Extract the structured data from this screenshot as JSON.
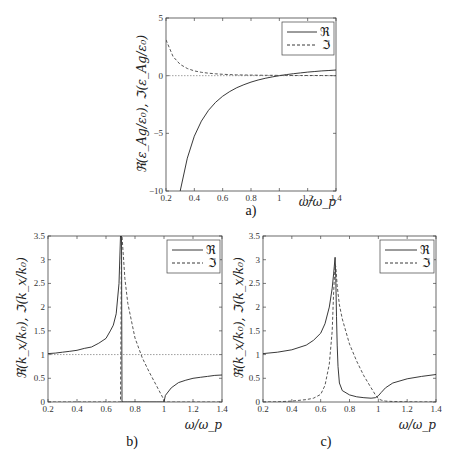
{
  "figure": {
    "panels": [
      {
        "id": "a",
        "caption": "a)",
        "ylabel": "ℜ(ε_Ag/ε₀), ℑ(ε_Ag/ε₀)",
        "xlabel": "ω/ω_p",
        "legend": [
          "ℜ",
          "ℑ"
        ],
        "box": {
          "x0": 166,
          "y0": 18,
          "x1": 336,
          "y1": 191
        },
        "xlim": [
          0.2,
          1.4
        ],
        "ylim": [
          -10,
          5
        ],
        "xticks": [
          "0.2",
          "0.4",
          "0.6",
          "0.8",
          "1",
          "1.2",
          "1.4"
        ],
        "yticks": [
          "-10",
          "-5",
          "0",
          "5"
        ],
        "ytick_values": [
          -10,
          -5,
          0,
          5
        ],
        "hline": 0,
        "legend_box": {
          "x": 282,
          "y": 22,
          "w": 52,
          "h": 33
        }
      },
      {
        "id": "b",
        "caption": "b)",
        "ylabel": "ℜ(k_x/k₀), ℑ(k_x/k₀)",
        "xlabel": "ω/ω_p",
        "legend": [
          "ℜ",
          "ℑ"
        ],
        "box": {
          "x0": 48,
          "y0": 236,
          "x1": 222,
          "y1": 402
        },
        "xlim": [
          0.2,
          1.4
        ],
        "ylim": [
          0,
          3.5
        ],
        "xticks": [
          "0.2",
          "0.4",
          "0.6",
          "0.8",
          "1",
          "1.2",
          "1.4"
        ],
        "yticks": [
          "0",
          "0.5",
          "1",
          "1.5",
          "2",
          "2.5",
          "3",
          "3.5"
        ],
        "ytick_values": [
          0,
          0.5,
          1,
          1.5,
          2,
          2.5,
          3,
          3.5
        ],
        "hline": 1,
        "legend_box": {
          "x": 167,
          "y": 240,
          "w": 53,
          "h": 33
        }
      },
      {
        "id": "c",
        "caption": "c)",
        "ylabel": "ℜ(k_x/k₀), ℑ(k_x/k₀)",
        "xlabel": "ω/ω_p",
        "legend": [
          "ℜ",
          "ℑ"
        ],
        "box": {
          "x0": 263,
          "y0": 236,
          "x1": 436,
          "y1": 402
        },
        "xlim": [
          0.2,
          1.4
        ],
        "ylim": [
          0,
          3.5
        ],
        "xticks": [
          "0.2",
          "0.4",
          "0.6",
          "0.8",
          "1",
          "1.2",
          "1.4"
        ],
        "yticks": [
          "0",
          "0.5",
          "1",
          "1.5",
          "2",
          "2.5",
          "3",
          "3.5"
        ],
        "ytick_values": [
          0,
          0.5,
          1,
          1.5,
          2,
          2.5,
          3,
          3.5
        ],
        "hline": null,
        "legend_box": {
          "x": 380,
          "y": 240,
          "w": 54,
          "h": 33
        }
      }
    ]
  },
  "chart_data": [
    {
      "type": "line",
      "title": "a)",
      "xlabel": "ω/ω_p",
      "ylabel": "ℜ(ε_Ag/ε₀), ℑ(ε_Ag/ε₀)",
      "xlim": [
        0.2,
        1.4
      ],
      "ylim": [
        -10,
        5
      ],
      "legend_position": "upper right",
      "x": [
        0.2,
        0.25,
        0.3,
        0.35,
        0.4,
        0.45,
        0.5,
        0.55,
        0.6,
        0.65,
        0.7,
        0.75,
        0.8,
        0.85,
        0.9,
        0.95,
        1.0,
        1.05,
        1.1,
        1.15,
        1.2,
        1.25,
        1.3,
        1.35,
        1.4
      ],
      "series": [
        {
          "name": "ℜ",
          "style": "solid",
          "values": [
            null,
            null,
            -10.1,
            -7.16,
            -5.25,
            -3.94,
            -3.0,
            -2.31,
            -1.78,
            -1.37,
            -1.04,
            -0.78,
            -0.56,
            -0.38,
            -0.23,
            -0.11,
            0.0,
            0.09,
            0.17,
            0.24,
            0.31,
            0.36,
            0.41,
            0.45,
            0.49
          ]
        },
        {
          "name": "ℑ",
          "style": "dashed",
          "values": [
            3.1,
            1.65,
            0.98,
            0.62,
            0.41,
            0.29,
            0.21,
            0.16,
            0.12,
            0.09,
            0.07,
            0.06,
            0.05,
            0.04,
            0.035,
            0.03,
            0.025,
            0.02,
            0.018,
            0.016,
            0.014,
            0.012,
            0.011,
            0.01,
            0.009
          ]
        }
      ],
      "reference_line": {
        "y": 0,
        "style": "dotted"
      }
    },
    {
      "type": "line",
      "title": "b)",
      "xlabel": "ω/ω_p",
      "ylabel": "ℜ(k_x/k₀), ℑ(k_x/k₀)",
      "xlim": [
        0.2,
        1.4
      ],
      "ylim": [
        0,
        3.5
      ],
      "legend_position": "upper right",
      "x": [
        0.2,
        0.25,
        0.3,
        0.35,
        0.4,
        0.45,
        0.5,
        0.55,
        0.6,
        0.63,
        0.65,
        0.67,
        0.69,
        0.7,
        0.707,
        0.71,
        0.73,
        0.75,
        0.8,
        0.85,
        0.9,
        0.95,
        0.99,
        1.0,
        1.01,
        1.05,
        1.1,
        1.15,
        1.2,
        1.25,
        1.3,
        1.35,
        1.4
      ],
      "series": [
        {
          "name": "ℜ",
          "style": "solid",
          "values": [
            1.02,
            1.03,
            1.05,
            1.07,
            1.09,
            1.13,
            1.16,
            1.24,
            1.34,
            1.5,
            1.62,
            1.86,
            2.5,
            3.5,
            3.5,
            0,
            0,
            0,
            0,
            0,
            0,
            0,
            0,
            0,
            0.14,
            0.3,
            0.41,
            0.46,
            0.5,
            0.52,
            0.54,
            0.56,
            0.57
          ]
        },
        {
          "name": "ℑ",
          "style": "dashed",
          "values": [
            0,
            0,
            0,
            0,
            0,
            0,
            0,
            0,
            0,
            0,
            0,
            0,
            0,
            0,
            3.5,
            3.5,
            2.6,
            2.08,
            1.35,
            0.93,
            0.62,
            0.33,
            0.1,
            0.02,
            0,
            0,
            0,
            0,
            0,
            0,
            0,
            0,
            0
          ]
        }
      ],
      "reference_line": {
        "y": 1,
        "style": "dotted"
      }
    },
    {
      "type": "line",
      "title": "c)",
      "xlabel": "ω/ω_p",
      "ylabel": "ℜ(k_x/k₀), ℑ(k_x/k₀)",
      "xlim": [
        0.2,
        1.4
      ],
      "ylim": [
        0,
        3.5
      ],
      "legend_position": "upper right",
      "x": [
        0.2,
        0.3,
        0.4,
        0.5,
        0.55,
        0.6,
        0.63,
        0.66,
        0.68,
        0.69,
        0.7,
        0.705,
        0.71,
        0.715,
        0.72,
        0.73,
        0.75,
        0.8,
        0.85,
        0.9,
        0.95,
        0.98,
        1.0,
        1.02,
        1.05,
        1.1,
        1.2,
        1.3,
        1.4
      ],
      "series": [
        {
          "name": "ℜ",
          "style": "solid",
          "values": [
            1.02,
            1.05,
            1.1,
            1.2,
            1.3,
            1.45,
            1.65,
            2.0,
            2.4,
            2.7,
            3.05,
            2.6,
            1.8,
            1.2,
            0.75,
            0.4,
            0.24,
            0.15,
            0.11,
            0.09,
            0.08,
            0.09,
            0.13,
            0.2,
            0.3,
            0.4,
            0.49,
            0.54,
            0.58
          ]
        },
        {
          "name": "ℑ",
          "style": "dashed",
          "values": [
            0,
            0.005,
            0.02,
            0.05,
            0.08,
            0.16,
            0.35,
            0.8,
            1.5,
            2.3,
            2.9,
            2.85,
            2.65,
            2.45,
            2.3,
            2.05,
            1.75,
            1.22,
            0.86,
            0.55,
            0.3,
            0.15,
            0.07,
            0.04,
            0.02,
            0.01,
            0.005,
            0.003,
            0.002
          ]
        }
      ],
      "reference_line": null
    }
  ]
}
